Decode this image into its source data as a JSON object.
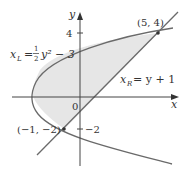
{
  "diagram": {
    "type": "region-between-curves",
    "axes": {
      "x_label": "x",
      "y_label": "y",
      "origin_label": "0",
      "y_ticks": [
        {
          "value": 4,
          "label": "4"
        },
        {
          "value": -2,
          "label": "−2"
        }
      ]
    },
    "curves": [
      {
        "name": "left-parabola",
        "equation_var": "x",
        "equation_sub": "L",
        "equation_rest": "y² − 3",
        "frac_num": "1",
        "frac_den": "2"
      },
      {
        "name": "right-line",
        "equation_var": "x",
        "equation_sub": "R",
        "equation_rest": "= y + 1"
      }
    ],
    "points": [
      {
        "label": "(5, 4)",
        "x": 5,
        "y": 4
      },
      {
        "label": "(−1, −2)",
        "x": -1,
        "y": -2
      }
    ],
    "colors": {
      "curve": "#6a6a6a",
      "axis": "#444444",
      "shade": "#e6e6e6",
      "text": "#333333"
    }
  }
}
